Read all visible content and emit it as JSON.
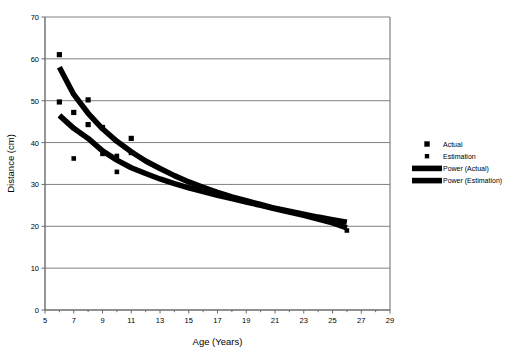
{
  "chart_data": {
    "type": "scatter",
    "title": "",
    "xlabel": "Age (Years)",
    "ylabel": "Distance (cm)",
    "xlim": [
      5,
      29
    ],
    "ylim": [
      0,
      70
    ],
    "xticks": [
      5,
      7,
      9,
      11,
      13,
      15,
      17,
      19,
      21,
      23,
      25,
      27,
      29
    ],
    "xtick_labels": [
      "5",
      "7",
      "9",
      "11",
      "13",
      "15",
      "17",
      "19",
      "21",
      "23",
      "25",
      "27",
      "29"
    ],
    "xtick_minor_step": 1,
    "yticks": [
      0,
      10,
      20,
      30,
      40,
      50,
      60,
      70
    ],
    "ytick_labels": [
      "0",
      "10",
      "20",
      "30",
      "40",
      "50",
      "60",
      "70"
    ],
    "grid": "horizontal",
    "legend_position": "right",
    "marker_color": "#000000",
    "line_color": "#000000",
    "grid_color": "#808080",
    "axis_color": "#808080",
    "series": [
      {
        "name": "Actual",
        "type": "scatter",
        "marker": "square",
        "points": [
          [
            6.0,
            61.0
          ],
          [
            6.0,
            49.7
          ],
          [
            7.0,
            47.2
          ],
          [
            8.0,
            50.2
          ],
          [
            8.0,
            44.3
          ],
          [
            9.0,
            43.6
          ],
          [
            11.0,
            41.0
          ],
          [
            11.0,
            37.6
          ]
        ]
      },
      {
        "name": "Estimation",
        "type": "scatter",
        "marker": "square",
        "points": [
          [
            7.0,
            36.2
          ],
          [
            9.0,
            37.3
          ],
          [
            10.0,
            36.8
          ],
          [
            10.0,
            33.0
          ],
          [
            26.0,
            19.0
          ]
        ]
      },
      {
        "name": "Power (Actual)",
        "type": "line",
        "curve": "power",
        "points": [
          [
            6.0,
            58.0
          ],
          [
            7.0,
            51.5
          ],
          [
            8.0,
            47.0
          ],
          [
            9.0,
            43.3
          ],
          [
            10.0,
            40.3
          ],
          [
            11.0,
            37.8
          ],
          [
            12.0,
            35.6
          ],
          [
            13.0,
            33.8
          ],
          [
            14.0,
            32.1
          ],
          [
            15.0,
            30.6
          ],
          [
            16.0,
            29.3
          ],
          [
            17.0,
            28.1
          ],
          [
            18.0,
            27.0
          ],
          [
            19.0,
            26.1
          ],
          [
            20.0,
            25.2
          ],
          [
            21.0,
            24.3
          ],
          [
            22.0,
            23.6
          ],
          [
            23.0,
            22.9
          ],
          [
            24.0,
            22.2
          ],
          [
            25.0,
            21.6
          ],
          [
            26.0,
            21.0
          ]
        ]
      },
      {
        "name": "Power (Estimation)",
        "type": "line",
        "curve": "power",
        "points": [
          [
            6.0,
            46.5
          ],
          [
            7.0,
            43.4
          ],
          [
            8.0,
            41.0
          ],
          [
            9.0,
            38.0
          ],
          [
            10.0,
            35.8
          ],
          [
            11.0,
            34.0
          ],
          [
            12.0,
            32.6
          ],
          [
            13.0,
            31.3
          ],
          [
            14.0,
            30.2
          ],
          [
            15.0,
            29.2
          ],
          [
            16.0,
            28.3
          ],
          [
            17.0,
            27.4
          ],
          [
            18.0,
            26.6
          ],
          [
            19.0,
            25.8
          ],
          [
            20.0,
            25.0
          ],
          [
            21.0,
            24.2
          ],
          [
            22.0,
            23.4
          ],
          [
            23.0,
            22.6
          ],
          [
            24.0,
            21.7
          ],
          [
            25.0,
            20.8
          ],
          [
            26.0,
            19.6
          ]
        ]
      }
    ],
    "legend": [
      {
        "label": "Actual",
        "kind": "marker",
        "size": "large"
      },
      {
        "label": "Estimation",
        "kind": "marker",
        "size": "small"
      },
      {
        "label": "Power (Actual)",
        "kind": "line"
      },
      {
        "label": "Power (Estimation)",
        "kind": "line"
      }
    ]
  }
}
